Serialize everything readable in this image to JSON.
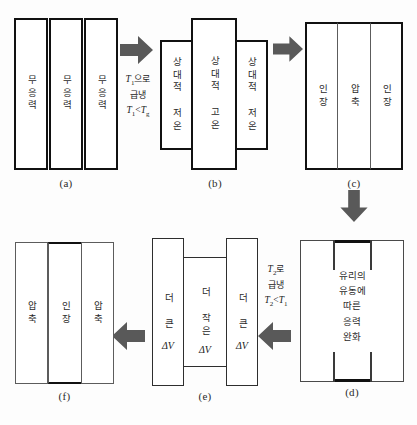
{
  "figure": {
    "title_caption_style": "alphabetic",
    "arrow_color": "#595959",
    "bar_border_dark": "#111111",
    "bar_border_gray": "#5c5c5c",
    "background": "#ffffff"
  },
  "panels": {
    "a": {
      "caption": "(a)",
      "bars": [
        {
          "label": "무응력"
        },
        {
          "label": "무응력"
        },
        {
          "label": "무응력"
        }
      ]
    },
    "b": {
      "caption": "(b)",
      "bars": [
        {
          "label": "상대적 저온"
        },
        {
          "label": "상대적 고온"
        },
        {
          "label": "상대적 저온"
        }
      ]
    },
    "c": {
      "caption": "(c)",
      "bars": [
        {
          "label": "인장"
        },
        {
          "label": "압축"
        },
        {
          "label": "인장"
        }
      ]
    },
    "d": {
      "caption": "(d)",
      "text": "유리의\n유동에\n따른\n응력\n완화"
    },
    "e": {
      "caption": "(e)",
      "bars": [
        {
          "label_line1": "더 큰",
          "label_line2": "ΔV"
        },
        {
          "label_line1": "더 작은",
          "label_line2": "ΔV"
        },
        {
          "label_line1": "더 큰",
          "label_line2": "ΔV"
        }
      ]
    },
    "f": {
      "caption": "(f)",
      "bars": [
        {
          "label": "압축"
        },
        {
          "label": "인장"
        },
        {
          "label": "압축"
        }
      ]
    }
  },
  "arrows": {
    "a_to_b": {
      "direction": "right",
      "label_line1_pre": "T",
      "label_line1_sub": "1",
      "label_line1_post": "으로",
      "label_line2": "급냉",
      "label_line3_pre": "T",
      "label_line3_sub": "1",
      "label_line3_mid": "<T",
      "label_line3_sub2": "g"
    },
    "b_to_c": {
      "direction": "right",
      "label": ""
    },
    "c_to_d": {
      "direction": "down",
      "label": ""
    },
    "d_to_e": {
      "direction": "left",
      "label_line1_pre": "T",
      "label_line1_sub": "2",
      "label_line1_post": "로",
      "label_line2": "급냉",
      "label_line3_pre": "T",
      "label_line3_sub": "2",
      "label_line3_mid": "<T",
      "label_line3_sub2": "1"
    },
    "e_to_f": {
      "direction": "left",
      "label": ""
    }
  }
}
